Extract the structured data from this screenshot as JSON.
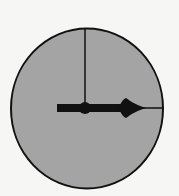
{
  "diagram": {
    "type": "clock-face",
    "time_shown": "3:00",
    "colors": {
      "background": "#f6f6f4",
      "face_fill": "#a4a4a4",
      "outline": "#111111",
      "hands": "#111111"
    },
    "face": {
      "cx": 87,
      "cy": 108.5,
      "rx": 76,
      "ry": 80,
      "stroke_width": 2
    },
    "minute_hand": {
      "direction": "12 o'clock",
      "x": 85,
      "y1": 28,
      "y2": 108,
      "stroke_width": 1.5
    },
    "hour_hand": {
      "direction": "3 o'clock",
      "x1": 57,
      "x2": 145,
      "y": 108,
      "stroke_width": 8
    },
    "extension_line": {
      "x1": 140,
      "x2": 163,
      "y": 108,
      "stroke_width": 1.5
    },
    "hub": {
      "cx": 85,
      "cy": 108,
      "r": 6
    }
  }
}
